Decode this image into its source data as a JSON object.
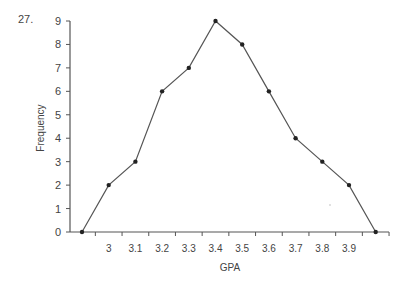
{
  "question_number": "27.",
  "chart_data": {
    "type": "line",
    "title": "",
    "xlabel": "GPA",
    "ylabel": "Frequency",
    "x_tick_labels": [
      "3",
      "3.1",
      "3.2",
      "3.3",
      "3.4",
      "3.5",
      "3.6",
      "3.7",
      "3.8",
      "3.9"
    ],
    "y_tick_labels": [
      "0",
      "1",
      "2",
      "3",
      "4",
      "5",
      "6",
      "7",
      "8",
      "9"
    ],
    "ylim": [
      0,
      9
    ],
    "grid": false,
    "legend": null,
    "x": [
      2.9,
      3.0,
      3.1,
      3.2,
      3.3,
      3.4,
      3.5,
      3.6,
      3.7,
      3.8,
      3.9,
      4.0
    ],
    "values": [
      0,
      2,
      3,
      6,
      7,
      9,
      8,
      6,
      4,
      3,
      2,
      0
    ],
    "series": [
      {
        "name": "Frequency polygon",
        "values": [
          0,
          2,
          3,
          6,
          7,
          9,
          8,
          6,
          4,
          3,
          2,
          0
        ]
      }
    ]
  }
}
